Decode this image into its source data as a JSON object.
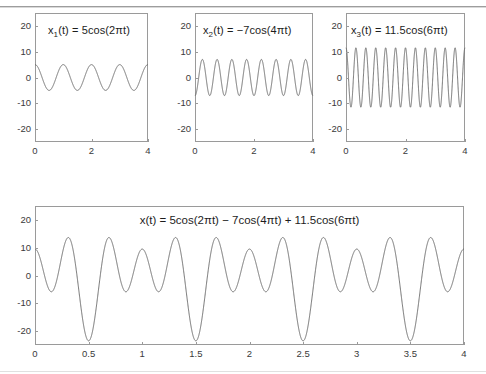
{
  "figure": {
    "background": "#ffffff",
    "axis_color": "#9a9a9a",
    "curve_color": "#6d6d6d",
    "text_color": "#1d1d1d"
  },
  "chart_data": [
    {
      "id": "x1",
      "type": "line",
      "title": "x₁(t) = 5cos(2πt)",
      "title_base": "x",
      "title_sub": "1",
      "title_rest": "(t) = 5cos(2πt)",
      "expression": "5*cos(2*pi*t)",
      "amplitude": 5,
      "frequency_hz": 1,
      "phase": 0,
      "xlabel": "",
      "ylabel": "",
      "xlim": [
        0,
        4
      ],
      "ylim": [
        -25,
        25
      ],
      "xticks": [
        0,
        2,
        4
      ],
      "xticklabels": [
        "0",
        "2",
        "4"
      ],
      "yticks": [
        -20,
        -10,
        0,
        10,
        20
      ],
      "yticklabels": [
        "-20",
        "-10",
        "0",
        "10",
        "20"
      ],
      "grid": false,
      "legend": "none"
    },
    {
      "id": "x2",
      "type": "line",
      "title": "x₂(t) = −7cos(4πt)",
      "title_base": "x",
      "title_sub": "2",
      "title_rest": "(t) = −7cos(4πt)",
      "expression": "-7*cos(4*pi*t)",
      "amplitude": -7,
      "frequency_hz": 2,
      "phase": 0,
      "xlabel": "",
      "ylabel": "",
      "xlim": [
        0,
        4
      ],
      "ylim": [
        -25,
        25
      ],
      "xticks": [
        0,
        2,
        4
      ],
      "xticklabels": [
        "0",
        "2",
        "4"
      ],
      "yticks": [
        -20,
        -10,
        0,
        10,
        20
      ],
      "yticklabels": [
        "-20",
        "-10",
        "0",
        "10",
        "20"
      ],
      "grid": false,
      "legend": "none"
    },
    {
      "id": "x3",
      "type": "line",
      "title": "x₃(t) = 11.5cos(6πt)",
      "title_base": "x",
      "title_sub": "3",
      "title_rest": "(t) = 11.5cos(6πt)",
      "expression": "11.5*cos(6*pi*t)",
      "amplitude": 11.5,
      "frequency_hz": 3,
      "phase": 0,
      "xlabel": "",
      "ylabel": "",
      "xlim": [
        0,
        4
      ],
      "ylim": [
        -25,
        25
      ],
      "xticks": [
        0,
        2,
        4
      ],
      "xticklabels": [
        "0",
        "2",
        "4"
      ],
      "yticks": [
        -20,
        -10,
        0,
        10,
        20
      ],
      "yticklabels": [
        "-20",
        "-10",
        "0",
        "10",
        "20"
      ],
      "grid": false,
      "legend": "none"
    },
    {
      "id": "x_sum",
      "type": "line",
      "title": "x(t) = 5cos(2πt) − 7cos(4πt) + 11.5cos(6πt)",
      "expression": "5*cos(2*pi*t) - 7*cos(4*pi*t) + 11.5*cos(6*pi*t)",
      "components": [
        {
          "amplitude": 5,
          "frequency_hz": 1
        },
        {
          "amplitude": -7,
          "frequency_hz": 2
        },
        {
          "amplitude": 11.5,
          "frequency_hz": 3
        }
      ],
      "value_at_t0": 9.5,
      "max_value": 14.2,
      "min_value": -23.5,
      "period_s": 1,
      "xlabel": "",
      "ylabel": "",
      "xlim": [
        0,
        4
      ],
      "ylim": [
        -25,
        25
      ],
      "xticks": [
        0,
        0.5,
        1,
        1.5,
        2,
        2.5,
        3,
        3.5,
        4
      ],
      "xticklabels": [
        "0",
        "0.5",
        "1",
        "1.5",
        "2",
        "2.5",
        "3",
        "3.5",
        "4"
      ],
      "yticks": [
        -20,
        -10,
        0,
        10,
        20
      ],
      "yticklabels": [
        "-20",
        "-10",
        "0",
        "10",
        "20"
      ],
      "grid": false,
      "legend": "none"
    }
  ]
}
